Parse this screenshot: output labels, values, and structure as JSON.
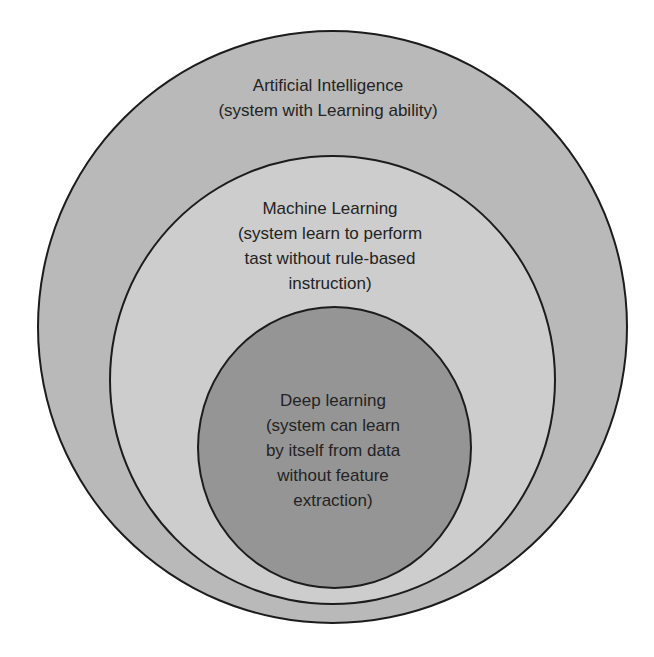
{
  "diagram": {
    "type": "nested-circles (euler/venn subset diagram)",
    "colors": {
      "background": "#ffffff",
      "outline": "#1c1c1c",
      "text": "#232323",
      "outer_fill": "#b9b9b9",
      "middle_fill": "#cdcdcd",
      "inner_fill": "#959595"
    },
    "circles": [
      {
        "id": "artificial-intelligence",
        "title": "Artificial Intelligence",
        "description_lines": [
          "(system with Learning ability)"
        ]
      },
      {
        "id": "machine-learning",
        "title": "Machine Learning",
        "description_lines": [
          "(system learn to perform",
          "tast without rule-based",
          "instruction)"
        ]
      },
      {
        "id": "deep-learning",
        "title": "Deep learning",
        "description_lines": [
          "(system can learn",
          "by itself from data",
          "without feature",
          "extraction)"
        ]
      }
    ]
  }
}
